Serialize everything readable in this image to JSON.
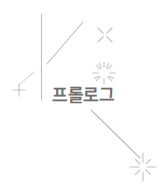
{
  "canvas": {
    "width": 168,
    "height": 196,
    "background_color": "#ffffff"
  },
  "title": {
    "text": "프롤로그",
    "color": "#6e6e6e",
    "font_size_px": 17
  },
  "decorations": {
    "line_color": "#b5b5b5",
    "sparkle_color": "#c9c9c9",
    "lines": [
      {
        "name": "vertical-divider-line",
        "x1": 41.5,
        "y1": 14,
        "x2": 41.5,
        "y2": 100
      },
      {
        "name": "diagonal-line-upper",
        "x1": 47,
        "y1": 64,
        "x2": 83,
        "y2": 22
      },
      {
        "name": "diagonal-line-lower",
        "x1": 91,
        "y1": 110,
        "x2": 140,
        "y2": 158
      }
    ],
    "sparkles": [
      {
        "name": "sparkle-x-top-right",
        "type": "x-cross",
        "cx": 105,
        "cy": 35,
        "r": 9
      },
      {
        "name": "sparkle-burst-center",
        "type": "radial-burst",
        "cx": 104,
        "cy": 73,
        "r": 11,
        "rays": 12
      },
      {
        "name": "sparkle-plus-left",
        "type": "plus-cross",
        "cx": 19,
        "cy": 90,
        "r": 7
      },
      {
        "name": "sparkle-star-bottom-right",
        "type": "four-point-star",
        "cx": 143,
        "cy": 167,
        "r": 13
      }
    ]
  }
}
